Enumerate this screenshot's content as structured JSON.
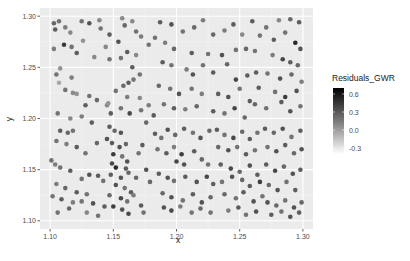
{
  "chart_data": {
    "type": "scatter",
    "title": "",
    "xlabel": "x",
    "ylabel": "y",
    "xlim": [
      1.092,
      1.308
    ],
    "ylim": [
      1.092,
      1.308
    ],
    "x_ticks": [
      1.1,
      1.15,
      1.2,
      1.25,
      1.3
    ],
    "x_tick_labels": [
      "1.10",
      "1.15",
      "1.20",
      "1.25",
      "1.30"
    ],
    "y_ticks": [
      1.1,
      1.15,
      1.2,
      1.25,
      1.3
    ],
    "y_tick_labels": [
      "1.10",
      "1.15",
      "1.20",
      "1.25",
      "1.30"
    ],
    "grid": true,
    "panel_background": "#ebebeb",
    "legend": {
      "title": "Residuals_GWR",
      "position": "right",
      "type": "colorbar",
      "low_color": "#ffffff",
      "high_color": "#000000",
      "range": [
        -0.4,
        0.7
      ],
      "breaks": [
        0.6,
        0.3,
        0.0,
        -0.3
      ],
      "break_labels": [
        "0.6",
        "0.3",
        "0.0",
        "-0.3"
      ]
    },
    "color_variable": "Residuals_GWR",
    "points": [
      [
        1.103,
        1.293,
        0.25
      ],
      [
        1.107,
        1.295,
        0.2
      ],
      [
        1.104,
        1.287,
        0.3
      ],
      [
        1.112,
        1.289,
        0.15
      ],
      [
        1.116,
        1.284,
        0.1
      ],
      [
        1.125,
        1.295,
        0.2
      ],
      [
        1.131,
        1.293,
        0.35
      ],
      [
        1.139,
        1.296,
        0.1
      ],
      [
        1.14,
        1.288,
        0.2
      ],
      [
        1.147,
        1.282,
        0.3
      ],
      [
        1.103,
        1.268,
        0.15
      ],
      [
        1.111,
        1.272,
        0.45
      ],
      [
        1.117,
        1.27,
        0.2
      ],
      [
        1.121,
        1.264,
        0.3
      ],
      [
        1.135,
        1.26,
        0.1
      ],
      [
        1.147,
        1.258,
        0.2
      ],
      [
        1.126,
        1.276,
        0.05
      ],
      [
        1.144,
        1.27,
        0.1
      ],
      [
        1.108,
        1.249,
        0.05
      ],
      [
        1.105,
        1.243,
        0.2
      ],
      [
        1.117,
        1.24,
        0.15
      ],
      [
        1.107,
        1.235,
        -0.05
      ],
      [
        1.112,
        1.228,
        0.2
      ],
      [
        1.118,
        1.225,
        0.1
      ],
      [
        1.121,
        1.224,
        0.05
      ],
      [
        1.131,
        1.222,
        0.2
      ],
      [
        1.128,
        1.213,
        0.3
      ],
      [
        1.137,
        1.218,
        0.25
      ],
      [
        1.145,
        1.213,
        0.1
      ],
      [
        1.106,
        1.205,
        0.2
      ],
      [
        1.116,
        1.2,
        0.1
      ],
      [
        1.125,
        1.202,
        0.15
      ],
      [
        1.133,
        1.196,
        0.3
      ],
      [
        1.146,
        1.215,
        0.05
      ],
      [
        1.157,
        1.298,
        0.1
      ],
      [
        1.159,
        1.291,
        0.25
      ],
      [
        1.165,
        1.295,
        0.1
      ],
      [
        1.168,
        1.285,
        0.2
      ],
      [
        1.172,
        1.28,
        0.15
      ],
      [
        1.178,
        1.272,
        0.2
      ],
      [
        1.154,
        1.275,
        0.35
      ],
      [
        1.161,
        1.265,
        0.3
      ],
      [
        1.168,
        1.262,
        0.1
      ],
      [
        1.156,
        1.259,
        0.2
      ],
      [
        1.165,
        1.25,
        0.3
      ],
      [
        1.171,
        1.243,
        0.2
      ],
      [
        1.158,
        1.232,
        0.25
      ],
      [
        1.162,
        1.235,
        0.3
      ],
      [
        1.166,
        1.238,
        0.2
      ],
      [
        1.152,
        1.227,
        0.2
      ],
      [
        1.161,
        1.221,
        0.15
      ],
      [
        1.171,
        1.22,
        0.1
      ],
      [
        1.148,
        1.205,
        0.3
      ],
      [
        1.156,
        1.21,
        0.2
      ],
      [
        1.163,
        1.205,
        0.4
      ],
      [
        1.172,
        1.208,
        0.2
      ],
      [
        1.178,
        1.213,
        0.15
      ],
      [
        1.182,
        1.203,
        0.3
      ],
      [
        1.176,
        1.196,
        0.25
      ],
      [
        1.187,
        1.294,
        0.3
      ],
      [
        1.196,
        1.292,
        0.35
      ],
      [
        1.205,
        1.285,
        0.2
      ],
      [
        1.214,
        1.289,
        0.25
      ],
      [
        1.221,
        1.296,
        0.15
      ],
      [
        1.229,
        1.282,
        0.25
      ],
      [
        1.238,
        1.286,
        0.15
      ],
      [
        1.245,
        1.292,
        0.3
      ],
      [
        1.252,
        1.282,
        0.1
      ],
      [
        1.183,
        1.279,
        0.2
      ],
      [
        1.191,
        1.274,
        0.15
      ],
      [
        1.198,
        1.268,
        0.25
      ],
      [
        1.212,
        1.264,
        0.3
      ],
      [
        1.225,
        1.263,
        0.2
      ],
      [
        1.236,
        1.262,
        0.35
      ],
      [
        1.247,
        1.267,
        0.2
      ],
      [
        1.255,
        1.268,
        0.25
      ],
      [
        1.189,
        1.255,
        0.3
      ],
      [
        1.196,
        1.252,
        0.2
      ],
      [
        1.208,
        1.248,
        0.15
      ],
      [
        1.213,
        1.243,
        0.35
      ],
      [
        1.221,
        1.252,
        0.2
      ],
      [
        1.229,
        1.245,
        0.3
      ],
      [
        1.24,
        1.253,
        0.25
      ],
      [
        1.247,
        1.238,
        0.4
      ],
      [
        1.256,
        1.242,
        0.3
      ],
      [
        1.186,
        1.232,
        0.25
      ],
      [
        1.195,
        1.229,
        0.2
      ],
      [
        1.202,
        1.224,
        0.35
      ],
      [
        1.212,
        1.229,
        0.2
      ],
      [
        1.22,
        1.224,
        0.15
      ],
      [
        1.233,
        1.224,
        0.3
      ],
      [
        1.241,
        1.221,
        0.35
      ],
      [
        1.25,
        1.229,
        0.2
      ],
      [
        1.258,
        1.217,
        0.3
      ],
      [
        1.19,
        1.214,
        0.2
      ],
      [
        1.198,
        1.21,
        0.3
      ],
      [
        1.207,
        1.209,
        0.15
      ],
      [
        1.216,
        1.212,
        0.25
      ],
      [
        1.229,
        1.207,
        0.3
      ],
      [
        1.238,
        1.205,
        0.2
      ],
      [
        1.246,
        1.21,
        0.4
      ],
      [
        1.254,
        1.201,
        0.25
      ],
      [
        1.26,
        1.295,
        0.3
      ],
      [
        1.271,
        1.289,
        0.2
      ],
      [
        1.281,
        1.296,
        0.1
      ],
      [
        1.29,
        1.297,
        0.25
      ],
      [
        1.297,
        1.294,
        0.3
      ],
      [
        1.266,
        1.281,
        0.2
      ],
      [
        1.277,
        1.277,
        0.3
      ],
      [
        1.286,
        1.284,
        0.2
      ],
      [
        1.294,
        1.274,
        0.55
      ],
      [
        1.298,
        1.268,
        0.35
      ],
      [
        1.262,
        1.266,
        0.2
      ],
      [
        1.276,
        1.262,
        0.15
      ],
      [
        1.284,
        1.258,
        0.4
      ],
      [
        1.29,
        1.255,
        0.3
      ],
      [
        1.296,
        1.252,
        0.25
      ],
      [
        1.263,
        1.245,
        0.3
      ],
      [
        1.272,
        1.244,
        0.2
      ],
      [
        1.282,
        1.239,
        0.35
      ],
      [
        1.291,
        1.243,
        0.25
      ],
      [
        1.299,
        1.236,
        0.15
      ],
      [
        1.265,
        1.23,
        0.3
      ],
      [
        1.278,
        1.226,
        0.2
      ],
      [
        1.286,
        1.221,
        0.45
      ],
      [
        1.295,
        1.227,
        0.35
      ],
      [
        1.262,
        1.214,
        0.25
      ],
      [
        1.271,
        1.21,
        0.2
      ],
      [
        1.283,
        1.216,
        0.3
      ],
      [
        1.29,
        1.207,
        0.35
      ],
      [
        1.298,
        1.212,
        0.2
      ],
      [
        1.108,
        1.188,
        0.3
      ],
      [
        1.114,
        1.186,
        0.25
      ],
      [
        1.118,
        1.188,
        0.2
      ],
      [
        1.105,
        1.178,
        0.2
      ],
      [
        1.113,
        1.175,
        0.15
      ],
      [
        1.121,
        1.172,
        0.3
      ],
      [
        1.128,
        1.166,
        0.2
      ],
      [
        1.137,
        1.176,
        0.25
      ],
      [
        1.145,
        1.18,
        0.35
      ],
      [
        1.101,
        1.159,
        0.2
      ],
      [
        1.104,
        1.155,
        0.15
      ],
      [
        1.108,
        1.152,
        0.2
      ],
      [
        1.116,
        1.149,
        0.3
      ],
      [
        1.125,
        1.141,
        0.2
      ],
      [
        1.131,
        1.145,
        0.35
      ],
      [
        1.138,
        1.144,
        0.3
      ],
      [
        1.142,
        1.139,
        0.2
      ],
      [
        1.105,
        1.136,
        0.15
      ],
      [
        1.112,
        1.132,
        0.25
      ],
      [
        1.121,
        1.128,
        0.3
      ],
      [
        1.129,
        1.126,
        0.2
      ],
      [
        1.102,
        1.124,
        0.2
      ],
      [
        1.109,
        1.121,
        0.3
      ],
      [
        1.118,
        1.118,
        0.15
      ],
      [
        1.125,
        1.119,
        0.2
      ],
      [
        1.134,
        1.117,
        0.35
      ],
      [
        1.143,
        1.114,
        0.3
      ],
      [
        1.106,
        1.108,
        0.2
      ],
      [
        1.115,
        1.112,
        0.25
      ],
      [
        1.129,
        1.108,
        0.1
      ],
      [
        1.138,
        1.105,
        0.2
      ],
      [
        1.147,
        1.192,
        0.3
      ],
      [
        1.151,
        1.188,
        0.25
      ],
      [
        1.156,
        1.186,
        0.35
      ],
      [
        1.149,
        1.176,
        0.3
      ],
      [
        1.155,
        1.172,
        0.35
      ],
      [
        1.16,
        1.175,
        0.25
      ],
      [
        1.15,
        1.165,
        0.45
      ],
      [
        1.157,
        1.163,
        0.2
      ],
      [
        1.161,
        1.158,
        0.35
      ],
      [
        1.149,
        1.156,
        0.4
      ],
      [
        1.152,
        1.152,
        0.55
      ],
      [
        1.16,
        1.151,
        0.3
      ],
      [
        1.148,
        1.145,
        0.3
      ],
      [
        1.156,
        1.142,
        0.35
      ],
      [
        1.162,
        1.147,
        0.25
      ],
      [
        1.152,
        1.135,
        0.35
      ],
      [
        1.159,
        1.132,
        0.2
      ],
      [
        1.164,
        1.128,
        0.3
      ],
      [
        1.147,
        1.125,
        0.25
      ],
      [
        1.156,
        1.122,
        0.4
      ],
      [
        1.161,
        1.119,
        0.2
      ],
      [
        1.15,
        1.114,
        0.45
      ],
      [
        1.157,
        1.111,
        0.35
      ],
      [
        1.162,
        1.107,
        0.4
      ],
      [
        1.166,
        1.125,
        0.15
      ],
      [
        1.168,
        1.142,
        0.25
      ],
      [
        1.17,
        1.166,
        0.2
      ],
      [
        1.173,
        1.174,
        0.3
      ],
      [
        1.176,
        1.15,
        0.35
      ],
      [
        1.179,
        1.138,
        0.25
      ],
      [
        1.172,
        1.115,
        0.3
      ],
      [
        1.174,
        1.108,
        0.2
      ],
      [
        1.183,
        1.185,
        0.3
      ],
      [
        1.188,
        1.181,
        0.2
      ],
      [
        1.193,
        1.189,
        0.35
      ],
      [
        1.199,
        1.184,
        0.25
      ],
      [
        1.206,
        1.19,
        0.3
      ],
      [
        1.213,
        1.186,
        0.2
      ],
      [
        1.219,
        1.181,
        0.35
      ],
      [
        1.226,
        1.188,
        0.25
      ],
      [
        1.185,
        1.17,
        0.2
      ],
      [
        1.192,
        1.166,
        0.3
      ],
      [
        1.198,
        1.172,
        0.15
      ],
      [
        1.204,
        1.165,
        0.45
      ],
      [
        1.2,
        1.158,
        0.4
      ],
      [
        1.206,
        1.155,
        0.35
      ],
      [
        1.214,
        1.168,
        0.3
      ],
      [
        1.22,
        1.16,
        0.25
      ],
      [
        1.225,
        1.155,
        0.2
      ],
      [
        1.186,
        1.146,
        0.3
      ],
      [
        1.193,
        1.142,
        0.35
      ],
      [
        1.198,
        1.139,
        0.2
      ],
      [
        1.207,
        1.143,
        0.3
      ],
      [
        1.216,
        1.138,
        0.35
      ],
      [
        1.224,
        1.143,
        0.4
      ],
      [
        1.229,
        1.136,
        0.3
      ],
      [
        1.189,
        1.127,
        0.25
      ],
      [
        1.196,
        1.123,
        0.35
      ],
      [
        1.205,
        1.12,
        0.2
      ],
      [
        1.213,
        1.126,
        0.3
      ],
      [
        1.22,
        1.118,
        0.35
      ],
      [
        1.227,
        1.123,
        0.25
      ],
      [
        1.19,
        1.113,
        0.35
      ],
      [
        1.196,
        1.11,
        0.4
      ],
      [
        1.203,
        1.114,
        0.15
      ],
      [
        1.212,
        1.108,
        0.2
      ],
      [
        1.219,
        1.112,
        0.25
      ],
      [
        1.227,
        1.108,
        0.2
      ],
      [
        1.232,
        1.189,
        0.3
      ],
      [
        1.238,
        1.184,
        0.2
      ],
      [
        1.245,
        1.181,
        0.4
      ],
      [
        1.252,
        1.187,
        0.25
      ],
      [
        1.258,
        1.18,
        0.3
      ],
      [
        1.264,
        1.186,
        0.2
      ],
      [
        1.233,
        1.172,
        0.25
      ],
      [
        1.241,
        1.169,
        0.35
      ],
      [
        1.248,
        1.172,
        0.2
      ],
      [
        1.255,
        1.165,
        0.3
      ],
      [
        1.262,
        1.169,
        0.2
      ],
      [
        1.235,
        1.155,
        0.3
      ],
      [
        1.243,
        1.151,
        0.4
      ],
      [
        1.25,
        1.148,
        0.25
      ],
      [
        1.258,
        1.154,
        0.35
      ],
      [
        1.264,
        1.145,
        0.3
      ],
      [
        1.236,
        1.138,
        0.2
      ],
      [
        1.244,
        1.143,
        0.35
      ],
      [
        1.252,
        1.14,
        0.25
      ],
      [
        1.258,
        1.134,
        0.3
      ],
      [
        1.266,
        1.138,
        0.45
      ],
      [
        1.238,
        1.126,
        0.25
      ],
      [
        1.247,
        1.122,
        0.2
      ],
      [
        1.253,
        1.128,
        0.3
      ],
      [
        1.261,
        1.119,
        0.35
      ],
      [
        1.268,
        1.124,
        0.2
      ],
      [
        1.241,
        1.11,
        0.15
      ],
      [
        1.249,
        1.113,
        0.3
      ],
      [
        1.255,
        1.106,
        0.2
      ],
      [
        1.263,
        1.109,
        0.35
      ],
      [
        1.27,
        1.19,
        0.3
      ],
      [
        1.277,
        1.186,
        0.25
      ],
      [
        1.284,
        1.19,
        0.35
      ],
      [
        1.291,
        1.182,
        0.2
      ],
      [
        1.298,
        1.188,
        0.3
      ],
      [
        1.272,
        1.172,
        0.2
      ],
      [
        1.279,
        1.168,
        0.35
      ],
      [
        1.286,
        1.174,
        0.3
      ],
      [
        1.293,
        1.166,
        0.25
      ],
      [
        1.299,
        1.17,
        0.35
      ],
      [
        1.271,
        1.155,
        0.3
      ],
      [
        1.278,
        1.149,
        0.4
      ],
      [
        1.285,
        1.153,
        0.25
      ],
      [
        1.292,
        1.146,
        0.35
      ],
      [
        1.298,
        1.15,
        0.3
      ],
      [
        1.273,
        1.135,
        0.25
      ],
      [
        1.28,
        1.13,
        0.35
      ],
      [
        1.287,
        1.138,
        0.2
      ],
      [
        1.294,
        1.13,
        0.3
      ],
      [
        1.272,
        1.118,
        0.35
      ],
      [
        1.279,
        1.115,
        0.25
      ],
      [
        1.286,
        1.12,
        0.2
      ],
      [
        1.293,
        1.113,
        0.35
      ],
      [
        1.299,
        1.118,
        0.25
      ],
      [
        1.275,
        1.106,
        0.3
      ],
      [
        1.283,
        1.109,
        0.2
      ],
      [
        1.29,
        1.104,
        0.35
      ],
      [
        1.297,
        1.108,
        0.3
      ]
    ]
  }
}
